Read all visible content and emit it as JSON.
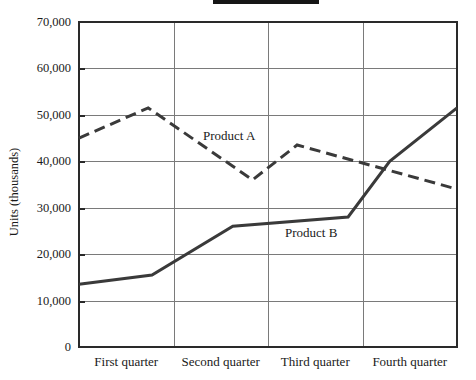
{
  "decorations": {
    "redacted_title_color": "#161616"
  },
  "y_axis": {
    "title": "Units (thousands)",
    "tick_labels": [
      "0",
      "10,000",
      "20,000",
      "30,000",
      "40,000",
      "50,000",
      "60,000",
      "70,000"
    ]
  },
  "x_axis": {
    "categories": [
      "First quarter",
      "Second quarter",
      "Third quarter",
      "Fourth quarter"
    ]
  },
  "chart_data": {
    "type": "line",
    "title": "",
    "ylabel": "Units (thousands)",
    "ylim": [
      0,
      70000
    ],
    "y_tick_step": 10000,
    "grid": true,
    "categories": [
      "First quarter",
      "Second quarter",
      "Third quarter",
      "Fourth quarter"
    ],
    "colors": {
      "line": "#3a3a3a",
      "frame": "#2a2a2a",
      "gridline": "#7a7a7a"
    },
    "series": [
      {
        "name": "Product A",
        "style": "dashed",
        "points": [
          {
            "f": 0.0,
            "v": 45000
          },
          {
            "f": 0.183,
            "v": 51500
          },
          {
            "f": 0.459,
            "v": 36000
          },
          {
            "f": 0.577,
            "v": 43500
          },
          {
            "f": 1.0,
            "v": 34000
          }
        ]
      },
      {
        "name": "Product B",
        "style": "solid",
        "points": [
          {
            "f": 0.0,
            "v": 13500
          },
          {
            "f": 0.193,
            "v": 15500
          },
          {
            "f": 0.407,
            "v": 26000
          },
          {
            "f": 0.712,
            "v": 28000
          },
          {
            "f": 0.822,
            "v": 40000
          },
          {
            "f": 1.0,
            "v": 51500
          }
        ]
      }
    ],
    "annotations": [
      {
        "text": "Product A",
        "x": 203,
        "y": 128
      },
      {
        "text": "Product B",
        "x": 285,
        "y": 225
      }
    ]
  }
}
